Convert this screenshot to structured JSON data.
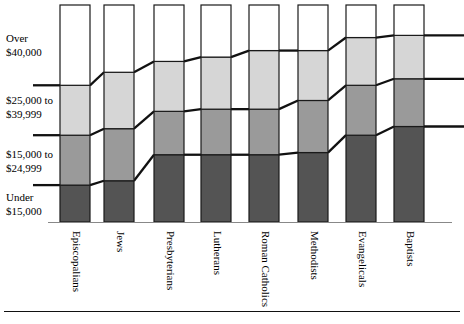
{
  "chart_data": {
    "type": "bar",
    "subtype": "stacked-bar-100-percent",
    "title": "",
    "xlabel": "",
    "ylabel": "",
    "grid": false,
    "legend_position": "left-axis-labels",
    "categories": [
      "Episcopalians",
      "Jews",
      "Presbyterians",
      "Lutherans",
      "Roman Catholics",
      "Methodists",
      "Evangelicals",
      "Baptists"
    ],
    "segment_order_bottom_to_top": [
      "Under $15,000",
      "$15,000 to $24,999",
      "$25,000 to $39,999",
      "Over $40,000"
    ],
    "series": [
      {
        "name": "Under $15,000",
        "color": "#545454",
        "values": [
          17,
          19,
          31,
          31,
          31,
          32,
          40,
          44
        ]
      },
      {
        "name": "$15,000 to $24,999",
        "color": "#9a9a9a",
        "values": [
          23,
          24,
          20,
          21,
          21,
          24,
          23,
          22
        ]
      },
      {
        "name": "$25,000 to $39,999",
        "color": "#d6d6d6",
        "values": [
          23,
          26,
          23,
          24,
          27,
          23,
          22,
          20
        ]
      },
      {
        "name": "Over $40,000",
        "color": "#ffffff",
        "values": [
          37,
          31,
          26,
          24,
          21,
          21,
          15,
          14
        ]
      }
    ],
    "ylim": [
      0,
      100
    ],
    "axis_labels": [
      {
        "id": "over-40000",
        "line1": "Over",
        "line2": "$40,000"
      },
      {
        "id": "25000-39999",
        "line1": "$25,000 to",
        "line2": "$39,999"
      },
      {
        "id": "15000-24999",
        "line1": "$15,000 to",
        "line2": "$24,999"
      },
      {
        "id": "under-15000",
        "line1": "Under",
        "line2": "$15,000"
      }
    ]
  }
}
